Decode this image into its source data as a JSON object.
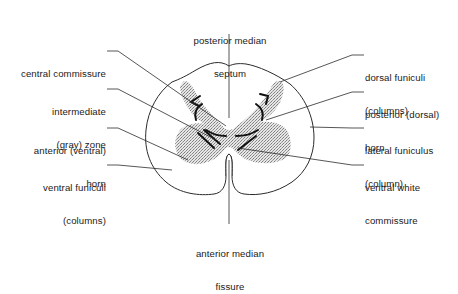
{
  "diagram": {
    "colors": {
      "line": "#2b2b2b",
      "gray_matter_stipple": "#bdbdbd",
      "background": "#ffffff",
      "text": "#1a1a1a"
    },
    "labels": {
      "posterior_median_septum": {
        "line1": "posterior median",
        "line2": "septum"
      },
      "central_commissure": {
        "line1": "central commissure"
      },
      "intermediate_zone": {
        "line1": "intermediate",
        "line2": "(gray) zone"
      },
      "anterior_horn": {
        "line1": "anterior (ventral)",
        "line2": "horn"
      },
      "ventral_funiculi": {
        "line1": "ventral funiculi",
        "line2": "(columns)"
      },
      "anterior_median_fissure": {
        "line1": "anterior median",
        "line2": "fissure"
      },
      "dorsal_funiculi": {
        "line1": "dorsal funiculi",
        "line2": "(columns)"
      },
      "posterior_horn": {
        "line1": "posterior (dorsal)",
        "line2": "horn"
      },
      "lateral_funiculus": {
        "line1": "lateral funiculus",
        "line2": "(column)"
      },
      "ventral_white_commissure": {
        "line1": "ventral white",
        "line2": "commissure"
      }
    }
  }
}
